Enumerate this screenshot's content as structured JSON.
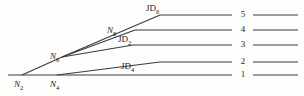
{
  "diagram": {
    "stroke_color": "#3a3a3a",
    "text_color": "#1c1c1c",
    "background_color": "#fdfdfc",
    "nodes": [
      {
        "id": "n2",
        "base": "N",
        "subscript": "2",
        "x": 14,
        "y": 80
      },
      {
        "id": "n4",
        "base": "N",
        "subscript": "4",
        "x": 50,
        "y": 80
      },
      {
        "id": "n6",
        "base": "N",
        "subscript": "6",
        "x": 50,
        "y": 52
      },
      {
        "id": "n8",
        "base": "N",
        "subscript": "8",
        "x": 107,
        "y": 26
      }
    ],
    "junctions": [
      {
        "id": "jd6",
        "base": "JD",
        "subscript": "6",
        "x": 146,
        "y": 4
      },
      {
        "id": "jd2",
        "base": "JD",
        "subscript": "2",
        "x": 118,
        "y": 35
      },
      {
        "id": "jd4",
        "base": "JD",
        "subscript": "4",
        "x": 121,
        "y": 62
      }
    ],
    "levels": [
      {
        "id": "level5",
        "label": "5",
        "x": 242,
        "y": 10
      },
      {
        "id": "level4",
        "label": "4",
        "x": 242,
        "y": 25
      },
      {
        "id": "level3",
        "label": "3",
        "x": 242,
        "y": 40
      },
      {
        "id": "level2",
        "label": "2",
        "x": 242,
        "y": 57
      },
      {
        "id": "level1",
        "label": "1",
        "x": 242,
        "y": 70
      }
    ],
    "geometry": {
      "baseline": {
        "x1": 8,
        "y1": 75,
        "x2": 232,
        "y2": 75
      },
      "rails": [
        {
          "id": "rail5",
          "x1": 160,
          "y1": 15,
          "x2": 232,
          "y2": 15
        },
        {
          "id": "rail4",
          "x1": 135,
          "y1": 30,
          "x2": 232,
          "y2": 30
        },
        {
          "id": "rail3",
          "x1": 133,
          "y1": 45,
          "x2": 232,
          "y2": 45
        },
        {
          "id": "rail2",
          "x1": 160,
          "y1": 62,
          "x2": 232,
          "y2": 62
        }
      ],
      "tails": [
        {
          "id": "tail5",
          "x1": 253,
          "y1": 15,
          "x2": 298,
          "y2": 15
        },
        {
          "id": "tail4",
          "x1": 253,
          "y1": 30,
          "x2": 298,
          "y2": 30
        },
        {
          "id": "tail3",
          "x1": 253,
          "y1": 45,
          "x2": 298,
          "y2": 45
        },
        {
          "id": "tail2",
          "x1": 253,
          "y1": 62,
          "x2": 298,
          "y2": 62
        },
        {
          "id": "tail1",
          "x1": 253,
          "y1": 75,
          "x2": 298,
          "y2": 75
        }
      ],
      "diagonals": [
        {
          "id": "diag-n2-n6-jd6",
          "points": "22,75 62,57 160,15"
        },
        {
          "id": "diag-n6-jd2",
          "points": "62,57 133,45"
        },
        {
          "id": "diag-n4-jd4",
          "points": "57,75 160,62"
        },
        {
          "id": "diag-n6-rail4",
          "points": "62,57 135,30"
        }
      ]
    }
  }
}
